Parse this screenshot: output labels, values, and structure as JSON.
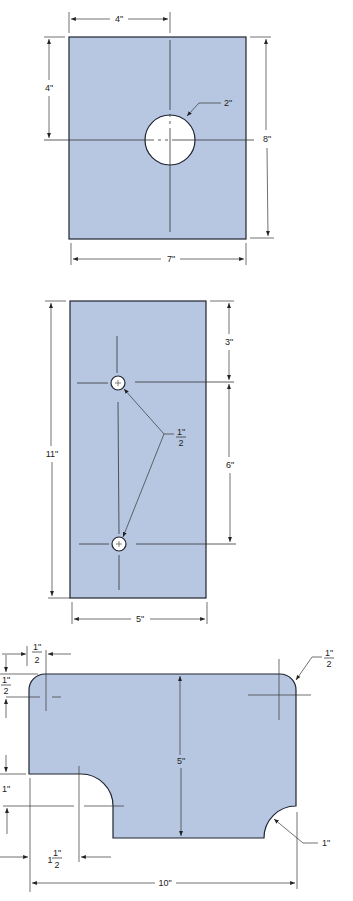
{
  "colors": {
    "plate_fill": "#b7c7e1",
    "outline": "#1f2430",
    "dim_line": "#333333",
    "hole_fill": "#ffffff"
  },
  "figures": [
    {
      "id": "plate-1",
      "description": "Rectangular plate with centered hole",
      "dimensions": {
        "top_hole_offset": "4\"",
        "left_hole_offset": "4\"",
        "hole_diameter": "2\"",
        "height": "8\"",
        "width": "7\""
      }
    },
    {
      "id": "plate-2",
      "description": "Rectangular plate with two small holes",
      "dimensions": {
        "height": "11\"",
        "top_to_first_hole": "3\"",
        "hole_spacing": "6\"",
        "hole_diameter_num": "1\"",
        "hole_diameter_den": "2",
        "width": "5\""
      }
    },
    {
      "id": "plate-3",
      "description": "Plate with rounded corners and notched arcs",
      "dimensions": {
        "corner_x_num": "1\"",
        "corner_x_den": "2",
        "corner_y_num": "1\"",
        "corner_y_den": "2",
        "right_corner_num": "1\"",
        "right_corner_den": "2",
        "height": "5\"",
        "notch_depth": "1\"",
        "notch_offset_whole": "1",
        "notch_offset_num": "1\"",
        "notch_offset_den": "2",
        "right_arc_radius": "1\"",
        "width": "10\""
      }
    }
  ]
}
